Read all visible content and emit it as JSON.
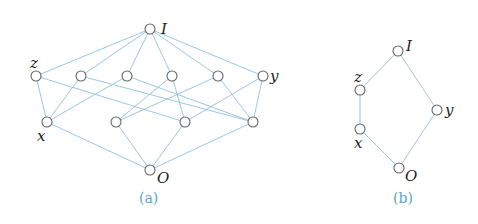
{
  "diagram": {
    "panel_a": {
      "caption": "(a)",
      "labels": {
        "top": "I",
        "bottom": "O",
        "z": "z",
        "x": "x",
        "y": "y"
      }
    },
    "panel_b": {
      "caption": "(b)",
      "labels": {
        "top": "I",
        "bottom": "O",
        "z": "z",
        "x": "x",
        "y": "y"
      }
    },
    "colors": {
      "edge": "#8fc1df",
      "node_stroke": "#666666",
      "caption": "#5aa6cf"
    }
  }
}
